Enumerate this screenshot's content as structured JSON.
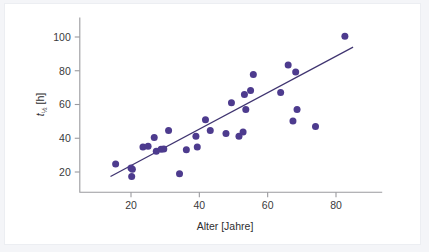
{
  "chart_data": {
    "type": "scatter",
    "title": "",
    "subtitle": "",
    "xlabel": "Alter [Jahre]",
    "ylabel": "t½ [h]",
    "ylabel_base": "t",
    "ylabel_subscript": "½",
    "ylabel_unit": " [h]",
    "xlim": [
      5,
      90
    ],
    "ylim": [
      8,
      108
    ],
    "xticks": [
      20,
      40,
      60,
      80
    ],
    "xtick_labels": [
      "20",
      "40",
      "60",
      "80"
    ],
    "yticks": [
      20,
      40,
      60,
      80,
      100
    ],
    "ytick_labels": [
      "20",
      "40",
      "60",
      "80",
      "100"
    ],
    "grid": false,
    "legend": null,
    "point_color": "#4d3b8e",
    "line_color": "#3f3470",
    "background_color": "#ffffff",
    "figure_background_color": "#f4f5f8",
    "series": [
      {
        "name": "Patienten",
        "marker": "circle",
        "points": [
          {
            "x": 15.5,
            "y": 24.7
          },
          {
            "x": 20.0,
            "y": 22.3
          },
          {
            "x": 20.2,
            "y": 17.3
          },
          {
            "x": 20.4,
            "y": 21.6
          },
          {
            "x": 23.5,
            "y": 34.8
          },
          {
            "x": 25.0,
            "y": 35.2
          },
          {
            "x": 26.8,
            "y": 40.4
          },
          {
            "x": 27.4,
            "y": 32.3
          },
          {
            "x": 28.8,
            "y": 33.5
          },
          {
            "x": 29.6,
            "y": 33.6
          },
          {
            "x": 31.0,
            "y": 44.6
          },
          {
            "x": 34.2,
            "y": 19.0
          },
          {
            "x": 36.2,
            "y": 33.2
          },
          {
            "x": 39.0,
            "y": 41.2
          },
          {
            "x": 39.4,
            "y": 34.8
          },
          {
            "x": 41.8,
            "y": 51.0
          },
          {
            "x": 43.2,
            "y": 44.6
          },
          {
            "x": 47.8,
            "y": 42.8
          },
          {
            "x": 49.4,
            "y": 61.0
          },
          {
            "x": 51.6,
            "y": 41.2
          },
          {
            "x": 52.8,
            "y": 43.7
          },
          {
            "x": 53.2,
            "y": 65.9
          },
          {
            "x": 53.6,
            "y": 57.0
          },
          {
            "x": 55.0,
            "y": 68.3
          },
          {
            "x": 55.8,
            "y": 77.8
          },
          {
            "x": 63.8,
            "y": 67.1
          },
          {
            "x": 66.0,
            "y": 83.4
          },
          {
            "x": 67.4,
            "y": 50.2
          },
          {
            "x": 68.2,
            "y": 79.2
          },
          {
            "x": 68.6,
            "y": 57.0
          },
          {
            "x": 74.0,
            "y": 47.0
          },
          {
            "x": 82.6,
            "y": 100.5
          }
        ]
      }
    ],
    "fit_line": {
      "name": "Regressionsgerade",
      "x_start": 14.0,
      "y_start": 17.3,
      "x_end": 85.0,
      "y_end": 94.0
    }
  }
}
